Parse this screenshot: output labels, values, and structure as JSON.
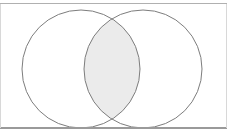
{
  "figure": {
    "type": "venn-two-set",
    "canvas": {
      "width": 227,
      "height": 138,
      "background_color": "#ffffff"
    },
    "borders": {
      "top_rule": {
        "y": 3.5,
        "x1": 0,
        "x2": 227,
        "color": "#b0b0b0",
        "width": 1.4
      },
      "bottom_rule": {
        "y": 128.0,
        "x1": 0,
        "x2": 227,
        "color": "#9a9a9a",
        "width": 1.2
      },
      "left_rule": {
        "x": 0.6,
        "y1": 3.5,
        "y2": 128.0,
        "color": "#d8d8d8",
        "width": 1
      },
      "right_rule": {
        "x": 226.4,
        "y1": 3.5,
        "y2": 128.0,
        "color": "#d8d8d8",
        "width": 1
      }
    },
    "sets": [
      {
        "name": "left-set",
        "label": "",
        "cx": 81,
        "cy": 69,
        "r": 59,
        "stroke_color": "#7d7d7d",
        "stroke_width": 1,
        "fill": "none"
      },
      {
        "name": "right-set",
        "label": "",
        "cx": 143,
        "cy": 69,
        "r": 59,
        "stroke_color": "#7d7d7d",
        "stroke_width": 1,
        "fill": "none"
      }
    ],
    "intersection": {
      "name": "intersection-region",
      "shaded": true,
      "fill_color": "#ebebeb",
      "top_crossing": {
        "x": 112,
        "y": 12.9
      },
      "bottom_crossing": {
        "x": 112,
        "y": 125.1
      },
      "left_extent_x": 84,
      "right_extent_x": 140
    },
    "labels": []
  }
}
